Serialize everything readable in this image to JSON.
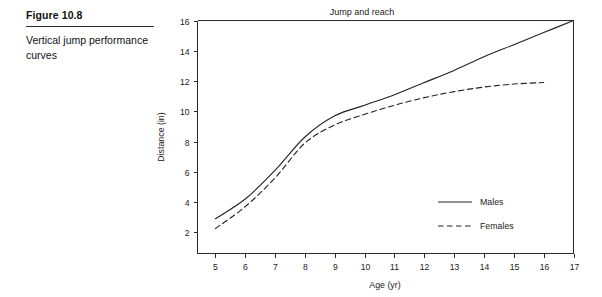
{
  "figure": {
    "number": "Figure 10.8",
    "caption": "Vertical jump performance curves"
  },
  "chart_data": {
    "type": "line",
    "title": "Jump and reach",
    "xlabel": "Age (yr)",
    "ylabel": "Distance (in)",
    "xlim": [
      4.4,
      17.0
    ],
    "ylim": [
      0.6,
      16.0
    ],
    "xticks": [
      5,
      6,
      7,
      8,
      9,
      10,
      11,
      12,
      13,
      14,
      15,
      16,
      17
    ],
    "xtick_labels": [
      "5",
      "6",
      "7",
      "8",
      "9",
      "10",
      "11",
      "12",
      "13",
      "14",
      "15",
      "16",
      "17"
    ],
    "yticks": [
      2,
      4,
      6,
      8,
      10,
      12,
      14,
      16
    ],
    "ytick_labels": [
      "2",
      "4",
      "6",
      "8",
      "10",
      "12",
      "14",
      "16"
    ],
    "grid": false,
    "legend_position": "lower-right",
    "x": [
      5,
      6,
      7,
      8,
      9,
      10,
      11,
      12,
      13,
      14,
      15,
      16,
      17
    ],
    "series": [
      {
        "name": "Males",
        "style": "solid",
        "color": "#222222",
        "values": [
          2.9,
          4.2,
          6.1,
          8.3,
          9.7,
          10.4,
          11.1,
          11.9,
          12.7,
          13.6,
          14.4,
          15.2,
          16.0
        ]
      },
      {
        "name": "Females",
        "style": "dashed",
        "color": "#222222",
        "values": [
          2.25,
          3.7,
          5.6,
          7.9,
          9.1,
          9.8,
          10.4,
          10.9,
          11.3,
          11.6,
          11.8,
          11.9,
          null
        ]
      }
    ]
  },
  "legend": {
    "entries": [
      {
        "label": "Males",
        "style": "solid"
      },
      {
        "label": "Females",
        "style": "dashed"
      }
    ]
  }
}
